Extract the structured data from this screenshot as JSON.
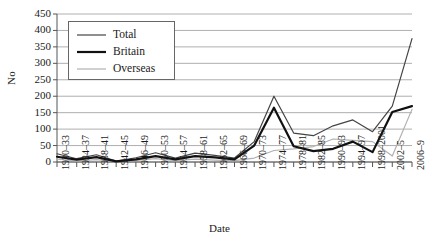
{
  "chart_data": {
    "type": "line",
    "title": "",
    "xlabel": "Date",
    "ylabel": "No",
    "ylim": [
      0,
      450
    ],
    "ytick_step": 50,
    "grid": true,
    "legend_position": "top-left",
    "categories": [
      "1930–33",
      "1934–37",
      "1938–41",
      "1942–45",
      "1946–49",
      "1950–53",
      "1954–57",
      "1958–61",
      "1962–65",
      "1966–69",
      "1970–73",
      "1974–77",
      "1978–81",
      "1982–85",
      "1990–93",
      "1994–97",
      "1998–2001",
      "2002–5",
      "2006–9"
    ],
    "series": [
      {
        "name": "Total",
        "color": "#444444",
        "width": 1.2,
        "values": [
          25,
          10,
          22,
          3,
          13,
          28,
          12,
          27,
          20,
          12,
          62,
          200,
          88,
          80,
          110,
          128,
          92,
          170,
          375
        ]
      },
      {
        "name": "Britain",
        "color": "#111111",
        "width": 2.2,
        "values": [
          16,
          7,
          15,
          2,
          8,
          18,
          8,
          18,
          14,
          8,
          50,
          165,
          48,
          33,
          40,
          62,
          30,
          152,
          170
        ]
      },
      {
        "name": "Overseas",
        "color": "#b0b0b0",
        "width": 1.2,
        "values": [
          9,
          3,
          7,
          1,
          5,
          10,
          4,
          9,
          6,
          4,
          12,
          35,
          40,
          47,
          70,
          66,
          62,
          18,
          160
        ]
      }
    ]
  },
  "legend": {
    "items": [
      {
        "label": "Total"
      },
      {
        "label": "Britain"
      },
      {
        "label": "Overseas"
      }
    ]
  },
  "axes": {
    "y_title": "No",
    "x_title": "Date",
    "y_ticks": [
      "0",
      "50",
      "100",
      "150",
      "200",
      "250",
      "300",
      "350",
      "400",
      "450"
    ]
  },
  "colors": {
    "total": "#444444",
    "britain": "#111111",
    "overseas": "#b0b0b0",
    "grid": "#8c8c8c",
    "axis": "#555555",
    "background": "#ffffff"
  }
}
